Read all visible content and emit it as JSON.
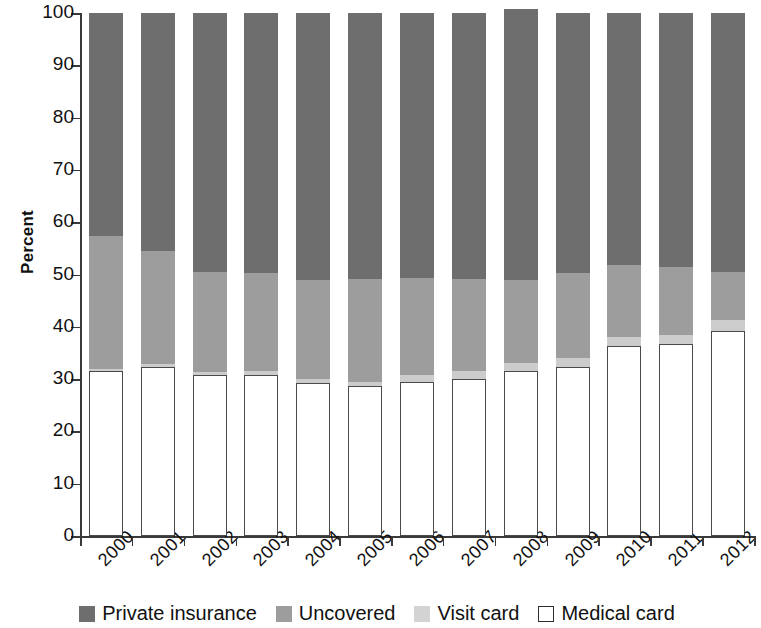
{
  "chart_data": {
    "type": "bar",
    "subtype": "stacked-bar-100",
    "title": "",
    "xlabel": "",
    "ylabel": "Percent",
    "ylim": [
      0,
      100
    ],
    "yticks": [
      0,
      10,
      20,
      30,
      40,
      50,
      60,
      70,
      80,
      90,
      100
    ],
    "grid": false,
    "legend_position": "bottom",
    "stack_order_bottom_to_top": [
      "Medical card",
      "Visit card",
      "Uncovered",
      "Private insurance"
    ],
    "categories": [
      "2000",
      "2001",
      "2002",
      "2003",
      "2004",
      "2005",
      "2006",
      "2007",
      "2008",
      "2009",
      "2010",
      "2011",
      "2012"
    ],
    "series": [
      {
        "name": "Medical card",
        "color": "#ffffff",
        "values": [
          31.5,
          32.3,
          30.8,
          30.7,
          29.3,
          28.6,
          29.5,
          30.0,
          31.5,
          32.3,
          36.4,
          36.7,
          39.2
        ]
      },
      {
        "name": "Visit card",
        "color": "#cccccc",
        "values": [
          0.5,
          0.5,
          0.6,
          0.8,
          0.8,
          0.9,
          1.3,
          1.5,
          1.6,
          1.7,
          1.6,
          1.8,
          2.1
        ]
      },
      {
        "name": "Uncovered",
        "color": "#9d9d9d",
        "values": [
          25.3,
          21.7,
          19.0,
          18.7,
          18.8,
          19.6,
          18.5,
          17.6,
          15.8,
          16.2,
          13.9,
          13.0,
          9.2
        ]
      },
      {
        "name": "Private insurance",
        "color": "#6e6e6e",
        "values": [
          42.7,
          45.5,
          49.6,
          49.8,
          51.1,
          50.9,
          50.7,
          50.9,
          51.8,
          49.8,
          48.1,
          48.5,
          49.5
        ]
      }
    ]
  },
  "axes": {
    "y_title": "Percent"
  },
  "legend": {
    "items": [
      {
        "label": "Private insurance",
        "swatch": "private-insurance-swatch"
      },
      {
        "label": "Uncovered",
        "swatch": "uncovered-swatch"
      },
      {
        "label": "Visit card",
        "swatch": "visit-card-swatch"
      },
      {
        "label": "Medical card",
        "swatch": "medical-card-swatch"
      }
    ]
  },
  "colors": {
    "private_insurance": "#6e6e6e",
    "uncovered": "#9d9d9d",
    "visit_card": "#cccccc",
    "medical_card": "#ffffff",
    "axis": "#3a3a3a",
    "text": "#111111"
  }
}
